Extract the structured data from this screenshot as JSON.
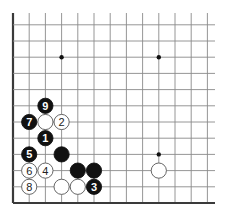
{
  "diagram": {
    "type": "go-board-fragment",
    "grid": {
      "origin_x": 13,
      "origin_y": 203,
      "spacing": 16.2,
      "columns": 13,
      "rows": 12,
      "right_extent": 215,
      "top_extent": 13,
      "edges": [
        "left",
        "bottom"
      ]
    },
    "colors": {
      "line": "#8a8a8a",
      "edge": "#3a3a3a",
      "black_stone": "#111111",
      "white_stone": "#ffffff",
      "stone_outline": "#555555"
    },
    "hoshi": [
      {
        "col": 3,
        "row": 9
      },
      {
        "col": 9,
        "row": 9
      },
      {
        "col": 9,
        "row": 3
      }
    ],
    "stones": [
      {
        "color": "black",
        "col": 2,
        "row": 6,
        "label": "9"
      },
      {
        "color": "black",
        "col": 1,
        "row": 5,
        "label": "7"
      },
      {
        "color": "white",
        "col": 2,
        "row": 5,
        "label": ""
      },
      {
        "color": "white",
        "col": 3,
        "row": 5,
        "label": "2"
      },
      {
        "color": "black",
        "col": 2,
        "row": 4,
        "label": "1"
      },
      {
        "color": "black",
        "col": 1,
        "row": 3,
        "label": "5"
      },
      {
        "color": "black",
        "col": 3,
        "row": 3,
        "label": ""
      },
      {
        "color": "white",
        "col": 1,
        "row": 2,
        "label": "6"
      },
      {
        "color": "white",
        "col": 2,
        "row": 2,
        "label": "4"
      },
      {
        "color": "black",
        "col": 4,
        "row": 2,
        "label": ""
      },
      {
        "color": "black",
        "col": 5,
        "row": 2,
        "label": ""
      },
      {
        "color": "white",
        "col": 1,
        "row": 1,
        "label": "8"
      },
      {
        "color": "white",
        "col": 3,
        "row": 1,
        "label": ""
      },
      {
        "color": "white",
        "col": 4,
        "row": 1,
        "label": ""
      },
      {
        "color": "black",
        "col": 5,
        "row": 1,
        "label": "3"
      },
      {
        "color": "white",
        "col": 9,
        "row": 2,
        "label": ""
      }
    ]
  }
}
